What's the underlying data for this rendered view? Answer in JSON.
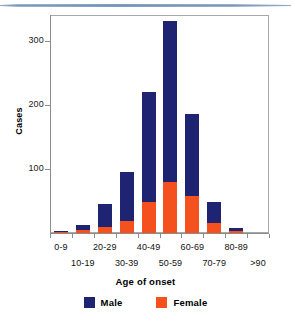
{
  "chart_data": {
    "type": "bar",
    "stacked": true,
    "title": "",
    "xlabel": "Age of onset",
    "ylabel": "Cases",
    "categories": [
      "0-9",
      "10-19",
      "20-29",
      "30-39",
      "40-49",
      "50-59",
      "60-69",
      "70-79",
      "80-89",
      ">90"
    ],
    "series": [
      {
        "name": "Male",
        "color": "#1f2472",
        "values": [
          1,
          7,
          35,
          77,
          172,
          250,
          128,
          33,
          5,
          0
        ]
      },
      {
        "name": "Female",
        "color": "#f4511e",
        "values": [
          2,
          5,
          10,
          18,
          48,
          80,
          57,
          15,
          3,
          0
        ]
      }
    ],
    "totals": [
      3,
      12,
      45,
      95,
      220,
      330,
      185,
      48,
      8,
      0
    ],
    "yticks": [
      100,
      200,
      300
    ],
    "ylim": [
      0,
      340
    ],
    "grid": false,
    "legend_position": "bottom"
  },
  "axes": {
    "y_title": "Cases",
    "x_title": "Age of onset",
    "y_tick_labels": [
      "300",
      "200",
      "100"
    ],
    "x_tick_labels": [
      "0-9",
      "10-19",
      "20-29",
      "30-39",
      "40-49",
      "50-59",
      "60-69",
      "70-79",
      "80-89",
      ">90"
    ]
  },
  "legend": {
    "items": [
      {
        "label": "Male",
        "color": "#1f2472"
      },
      {
        "label": "Female",
        "color": "#f4511e"
      }
    ]
  },
  "colors": {
    "male": "#1f2472",
    "female": "#f4511e",
    "axis": "#8c8c8c",
    "frame": "#a8a8a8",
    "rule": "#7f9ec0"
  }
}
